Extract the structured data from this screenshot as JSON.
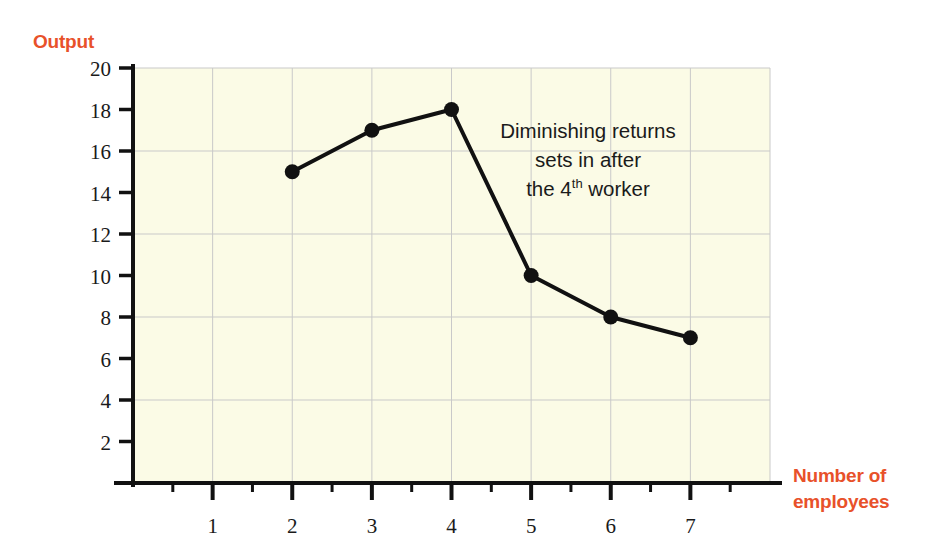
{
  "labels": {
    "y_axis_title": "Output",
    "x_axis_title_line1": "Number of",
    "x_axis_title_line2": "employees"
  },
  "annotation": {
    "line1": "Diminishing returns",
    "line2": "sets in after",
    "line3_pre": "the 4",
    "line3_sup": "th",
    "line3_post": " worker"
  },
  "colors": {
    "accent": "#e8512a",
    "plot_background": "#fbfbe6",
    "gridline": "#c9c9c9",
    "axis": "#111111",
    "series": "#111111",
    "tick_text": "#1a1a1a"
  },
  "chart_data": {
    "type": "line",
    "title": "",
    "xlabel": "Number of employees",
    "ylabel": "Output",
    "x": [
      2,
      3,
      4,
      5,
      6,
      7
    ],
    "values": [
      15,
      17,
      18,
      10,
      8,
      7
    ],
    "series": [
      {
        "name": "Output",
        "points": [
          {
            "x": 2,
            "y": 15
          },
          {
            "x": 3,
            "y": 17
          },
          {
            "x": 4,
            "y": 18
          },
          {
            "x": 5,
            "y": 10
          },
          {
            "x": 6,
            "y": 8
          },
          {
            "x": 7,
            "y": 7
          }
        ]
      }
    ],
    "xlim": [
      0,
      8
    ],
    "ylim": [
      0,
      20
    ],
    "x_tick_labels": [
      "1",
      "2",
      "3",
      "4",
      "5",
      "6",
      "7"
    ],
    "x_ticks": [
      1,
      2,
      3,
      4,
      5,
      6,
      7
    ],
    "x_minor_ticks": [
      0.5,
      1.5,
      2.5,
      3.5,
      4.5,
      5.5,
      6.5,
      7.5
    ],
    "y_tick_labels": [
      "2",
      "4",
      "6",
      "8",
      "10",
      "12",
      "14",
      "16",
      "18",
      "20"
    ],
    "y_ticks": [
      2,
      4,
      6,
      8,
      10,
      12,
      14,
      16,
      18,
      20
    ],
    "y_gridlines": [
      4,
      8,
      12,
      16,
      20
    ],
    "x_gridlines": [
      1,
      2,
      3,
      4,
      5,
      6,
      7
    ],
    "grid": true,
    "legend": "none",
    "markers": "filled-circle",
    "annotation_text": "Diminishing returns sets in after the 4th worker"
  }
}
